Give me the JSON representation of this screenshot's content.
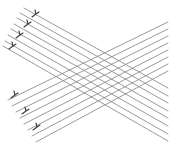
{
  "figure": {
    "colors": {
      "background": "#ffffff",
      "line": "#8e8e8e",
      "fork_marker": "#3a3a3a"
    },
    "descending_set": {
      "lines": [
        {
          "x1": 24,
          "y1": 8,
          "x2": 168,
          "y2": 88
        },
        {
          "x1": 20,
          "y1": 13,
          "x2": 168,
          "y2": 96
        },
        {
          "x1": 17,
          "y1": 18,
          "x2": 168,
          "y2": 103
        },
        {
          "x1": 14,
          "y1": 24,
          "x2": 168,
          "y2": 111
        },
        {
          "x1": 11,
          "y1": 29,
          "x2": 168,
          "y2": 118
        },
        {
          "x1": 8,
          "y1": 35,
          "x2": 168,
          "y2": 126
        },
        {
          "x1": 5,
          "y1": 41,
          "x2": 168,
          "y2": 134
        },
        {
          "x1": 3,
          "y1": 46,
          "x2": 168,
          "y2": 141
        }
      ],
      "fork_markers": [
        {
          "x": 36,
          "y": 14
        },
        {
          "x": 28,
          "y": 24
        },
        {
          "x": 20,
          "y": 35
        },
        {
          "x": 13,
          "y": 46
        }
      ]
    },
    "ascending_set": {
      "lines": [
        {
          "x1": 8,
          "y1": 100,
          "x2": 168,
          "y2": 22
        },
        {
          "x1": 12,
          "y1": 106,
          "x2": 168,
          "y2": 29
        },
        {
          "x1": 16,
          "y1": 112,
          "x2": 168,
          "y2": 36
        },
        {
          "x1": 20,
          "y1": 118,
          "x2": 168,
          "y2": 43
        },
        {
          "x1": 24,
          "y1": 124,
          "x2": 168,
          "y2": 50
        },
        {
          "x1": 28,
          "y1": 130,
          "x2": 168,
          "y2": 57
        },
        {
          "x1": 32,
          "y1": 136,
          "x2": 168,
          "y2": 64
        },
        {
          "x1": 36,
          "y1": 142,
          "x2": 168,
          "y2": 71
        }
      ],
      "fork_markers": [
        {
          "x": 15,
          "y": 95
        },
        {
          "x": 26,
          "y": 111
        },
        {
          "x": 37,
          "y": 127
        }
      ]
    }
  }
}
